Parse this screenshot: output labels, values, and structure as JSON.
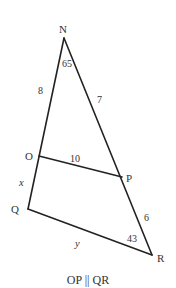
{
  "diagram": {
    "type": "geometry-triangle-with-parallel-segment",
    "stroke_color": "#222222",
    "text_color": "#333333",
    "vertices": {
      "N": {
        "label": "N"
      },
      "O": {
        "label": "O"
      },
      "P": {
        "label": "P"
      },
      "Q": {
        "label": "Q"
      },
      "R": {
        "label": "R"
      }
    },
    "segments": [
      {
        "from": "N",
        "to": "Q",
        "name": "NQ"
      },
      {
        "from": "N",
        "to": "R",
        "name": "NR"
      },
      {
        "from": "Q",
        "to": "R",
        "name": "QR"
      },
      {
        "from": "O",
        "to": "P",
        "name": "OP"
      }
    ],
    "measures": {
      "NO": "8",
      "NP": "7",
      "OP": "10",
      "PR": "6",
      "OQ": "x",
      "QR": "y",
      "angle_N": "65",
      "angle_R": "43"
    },
    "caption": "OP || QR"
  }
}
